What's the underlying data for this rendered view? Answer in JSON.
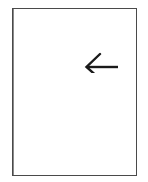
{
  "figure": {
    "caption": "",
    "background_color": "#ffffff",
    "border_color": "#4a4a4a",
    "ink_color": "#1a1a1a",
    "frame": {
      "label": "figure-frame",
      "x": 12,
      "y": 8,
      "width": 125,
      "height": 168
    },
    "arrow": {
      "label": "",
      "direction": "left",
      "glyph": "←",
      "color": "#1a1a1a",
      "x": 60,
      "y": 42,
      "width": 46,
      "height": 22
    },
    "dotted_lines": [
      {
        "label": "",
        "id": "upper",
        "y": 66,
        "x_start": 7,
        "width": 112,
        "dot_count": 17,
        "dot_spacing": 7,
        "color": "#2b2b2b"
      },
      {
        "label": "",
        "id": "lower",
        "y": 99,
        "x_start": 7,
        "width": 112,
        "dot_count": 17,
        "dot_spacing": 7,
        "color": "#2b2b2b"
      }
    ]
  }
}
